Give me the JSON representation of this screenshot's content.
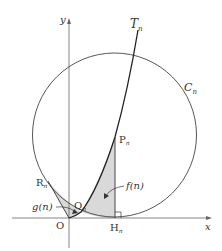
{
  "diagram": {
    "axes": {
      "x_label": "x",
      "y_label": "y",
      "origin_label": "O"
    },
    "curve": {
      "label": "T",
      "subscript": "n"
    },
    "circle": {
      "label": "C",
      "subscript": "n"
    },
    "points": {
      "P": {
        "label": "P",
        "subscript": "n"
      },
      "Q": {
        "label": "Q",
        "subscript": "n"
      },
      "R": {
        "label": "R",
        "subscript": "n"
      },
      "H": {
        "label": "H",
        "subscript": "n"
      }
    },
    "regions": {
      "f": {
        "label": "f(n)"
      },
      "g": {
        "label": "g(n)"
      }
    },
    "colors": {
      "line": "#333333",
      "shade": "#d9d9d9",
      "axis": "#666666"
    }
  }
}
